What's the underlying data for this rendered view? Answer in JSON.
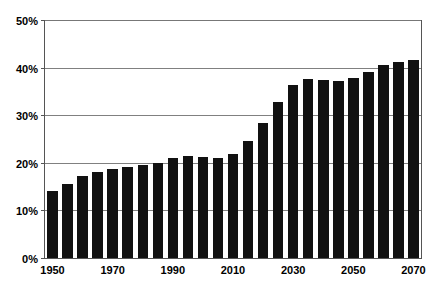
{
  "chart_data": {
    "type": "bar",
    "title": "",
    "xlabel": "",
    "ylabel": "",
    "ylim": [
      0,
      50
    ],
    "y_tick_labels": [
      "0%",
      "10%",
      "20%",
      "30%",
      "40%",
      "50%"
    ],
    "y_ticks": [
      0,
      10,
      20,
      30,
      40,
      50
    ],
    "grid": "horizontal",
    "legend": "none",
    "x_tick_labels": [
      "1950",
      "1970",
      "1990",
      "2010",
      "2030",
      "2050",
      "2070"
    ],
    "x_ticks": [
      1950,
      1970,
      1990,
      2010,
      2030,
      2050,
      2070
    ],
    "categories": [
      "1950",
      "1955",
      "1960",
      "1965",
      "1970",
      "1975",
      "1980",
      "1985",
      "1990",
      "1995",
      "2000",
      "2005",
      "2010",
      "2015",
      "2020",
      "2025",
      "2030",
      "2035",
      "2040",
      "2045",
      "2050",
      "2055",
      "2060",
      "2065",
      "2070"
    ],
    "values": [
      14.0,
      15.6,
      17.3,
      18.0,
      18.7,
      19.2,
      19.6,
      20.0,
      21.0,
      21.4,
      21.2,
      21.0,
      21.8,
      24.5,
      28.3,
      32.8,
      36.3,
      37.6,
      37.5,
      37.2,
      37.8,
      39.0,
      40.5,
      41.2,
      41.7
    ],
    "series": [
      {
        "name": "value",
        "values": [
          14.0,
          15.6,
          17.3,
          18.0,
          18.7,
          19.2,
          19.6,
          20.0,
          21.0,
          21.4,
          21.2,
          21.0,
          21.8,
          24.5,
          28.3,
          32.8,
          36.3,
          37.6,
          37.5,
          37.2,
          37.8,
          39.0,
          40.5,
          41.2,
          41.7
        ]
      }
    ],
    "colors": {
      "bar": "#111111",
      "gridline": "#808080",
      "axis": "#555555",
      "background": "#ffffff",
      "text": "#000000"
    }
  }
}
